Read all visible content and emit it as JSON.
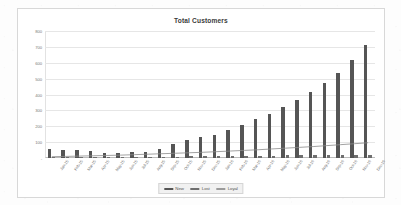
{
  "chart_data": {
    "type": "bar",
    "title": "Total Customers",
    "xlabel": "",
    "ylabel": "",
    "ylim": [
      0,
      800
    ],
    "yticks": [
      0,
      100,
      200,
      300,
      400,
      500,
      600,
      700,
      800
    ],
    "ytick_labels": [
      "-",
      "100",
      "200",
      "300",
      "400",
      "500",
      "600",
      "700",
      "800"
    ],
    "grid": true,
    "legend_position": "bottom",
    "categories": [
      "Jan-15",
      "Feb-15",
      "Mar-15",
      "Apr-15",
      "May-15",
      "Jun-15",
      "Jul-15",
      "Aug-15",
      "Sep-15",
      "Oct-15",
      "Nov-15",
      "Dec-15",
      "Jan-16",
      "Feb-16",
      "Mar-16",
      "Apr-16",
      "May-16",
      "Jun-16",
      "Jul-16",
      "Aug-16",
      "Sep-16",
      "Oct-16",
      "Nov-16",
      "Dec-16"
    ],
    "series": [
      {
        "name": "New",
        "type": "bar",
        "color": "#555555",
        "values": [
          55,
          52,
          48,
          44,
          33,
          30,
          35,
          36,
          58,
          88,
          113,
          130,
          148,
          175,
          208,
          245,
          280,
          322,
          363,
          413,
          470,
          535,
          620,
          710
        ]
      },
      {
        "name": "Lost",
        "type": "bar",
        "color": "#6f6f6f",
        "values": [
          6,
          6,
          6,
          6,
          6,
          6,
          7,
          7,
          8,
          9,
          10,
          10,
          11,
          12,
          13,
          14,
          15,
          16,
          17,
          18,
          19,
          20,
          21,
          22
        ]
      },
      {
        "name": "Loyal",
        "type": "line",
        "color": "#8a8a8a",
        "values": [
          8,
          10,
          12,
          14,
          16,
          18,
          21,
          24,
          27,
          30,
          33,
          36,
          40,
          44,
          48,
          52,
          57,
          62,
          67,
          72,
          78,
          84,
          90,
          96
        ]
      }
    ]
  },
  "legend": {
    "items": [
      {
        "label": "New",
        "color": "#555555"
      },
      {
        "label": "Lost",
        "color": "#6f6f6f"
      },
      {
        "label": "Loyal",
        "color": "#9b9b9b"
      }
    ]
  }
}
